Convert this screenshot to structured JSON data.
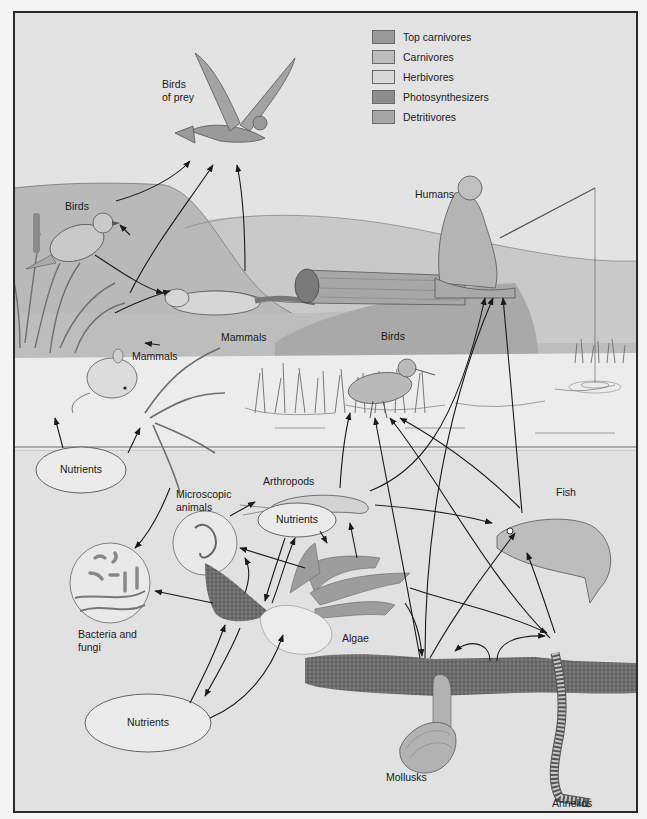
{
  "diagram": {
    "type": "food-web",
    "legend": [
      {
        "label": "Top carnivores",
        "color": "#9a9a9a"
      },
      {
        "label": "Carnivores",
        "color": "#bcbcbc"
      },
      {
        "label": "Herbivores",
        "color": "#d9d9d9"
      },
      {
        "label": "Photosynthesizers",
        "color": "#8c8c8c"
      },
      {
        "label": "Detritivores",
        "color": "#a6a6a6"
      }
    ],
    "labels": {
      "birds_of_prey": "Birds\nof prey",
      "birds_land": "Birds",
      "humans": "Humans",
      "mammals_weasel": "Mammals",
      "mammals_mouse": "Mammals",
      "birds_water": "Birds",
      "microscopic_animals": "Microscopic\nanimals",
      "arthropods": "Arthropods",
      "fish": "Fish",
      "bacteria_fungi": "Bacteria and\nfungi",
      "algae": "Algae",
      "mollusks": "Mollusks",
      "annelids": "Annelids"
    },
    "nutrients": [
      {
        "label": "Nutrients",
        "position": "shore"
      },
      {
        "label": "Nutrients",
        "position": "mid-water"
      },
      {
        "label": "Nutrients",
        "position": "bottom"
      }
    ],
    "links": [
      [
        "Birds",
        "Birds of prey"
      ],
      [
        "Mammals (mouse)",
        "Birds of prey"
      ],
      [
        "Mammals (weasel)",
        "Birds of prey"
      ],
      [
        "Birds",
        "Mammals (weasel)"
      ],
      [
        "Mammals (mouse)",
        "Mammals (weasel)"
      ],
      [
        "Plants",
        "Birds"
      ],
      [
        "Plants",
        "Mammals (mouse)"
      ],
      [
        "Nutrients",
        "Plants"
      ],
      [
        "Arthropods",
        "Birds (water)"
      ],
      [
        "Arthropods",
        "Fish"
      ],
      [
        "Arthropods",
        "Humans"
      ],
      [
        "Fish",
        "Humans"
      ],
      [
        "Mollusks",
        "Birds (water)"
      ],
      [
        "Mollusks",
        "Humans"
      ],
      [
        "Mollusks",
        "Fish"
      ],
      [
        "Annelids",
        "Fish"
      ],
      [
        "Annelids",
        "Birds (water)"
      ],
      [
        "Algae",
        "Arthropods"
      ],
      [
        "Algae",
        "Mollusks"
      ],
      [
        "Algae",
        "Annelids"
      ],
      [
        "Microscopic animals",
        "Arthropods"
      ],
      [
        "Detritus",
        "Bacteria and fungi"
      ],
      [
        "Nutrients",
        "Algae"
      ],
      [
        "Detritus",
        "Nutrients"
      ],
      [
        "Nutrients",
        "Detritus"
      ]
    ]
  }
}
